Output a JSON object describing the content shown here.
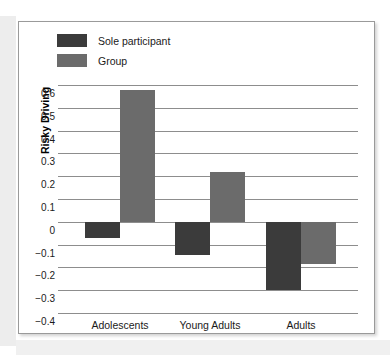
{
  "figure": {
    "yaxis_title": "Risky Driving"
  },
  "legend": {
    "items": [
      {
        "label": "Sole participant",
        "color": "#3b3b3b",
        "name": "legend-sole-participant"
      },
      {
        "label": "Group",
        "color": "#6b6b6b",
        "name": "legend-group"
      }
    ]
  },
  "chart_data": {
    "type": "bar",
    "title": "",
    "xlabel": "",
    "ylabel": "Risky Driving",
    "categories": [
      "Adolescents",
      "Young Adults",
      "Adults"
    ],
    "series": [
      {
        "name": "Sole participant",
        "color": "#3b3b3b",
        "values": [
          -0.07,
          -0.145,
          -0.3
        ]
      },
      {
        "name": "Group",
        "color": "#6b6b6b",
        "values": [
          0.58,
          0.22,
          -0.185
        ]
      }
    ],
    "ylim": [
      -0.4,
      0.6
    ],
    "yticks": [
      0.6,
      0.5,
      0.4,
      0.3,
      0.2,
      0.1,
      0,
      -0.1,
      -0.2,
      -0.3,
      -0.4
    ],
    "ytick_labels": [
      "0.6",
      "0.5",
      "0.4",
      "0.3",
      "0.2",
      "0.1",
      "0",
      "−0.1",
      "−0.2",
      "−0.3",
      "−0.4"
    ],
    "grid": true,
    "legend_position": "top-left",
    "orientation": "vertical"
  }
}
